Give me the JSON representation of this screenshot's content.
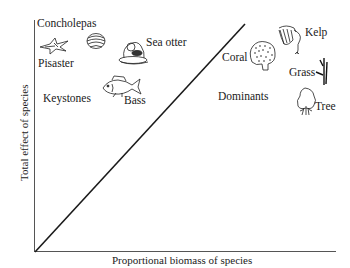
{
  "diagram": {
    "axes": {
      "x_label": "Proportional biomass of species",
      "y_label": "Total effect of species"
    },
    "reference_line": {
      "from": [
        0,
        0
      ],
      "to": [
        0.7,
        1.0
      ],
      "description": "diagonal line from origin"
    },
    "groups": {
      "keystones": {
        "label": "Keystones",
        "region": "above line (upper-left)"
      },
      "dominants": {
        "label": "Dominants",
        "region": "below line (right)"
      }
    },
    "species": [
      {
        "name": "Concholepas",
        "icon": "shell-icon",
        "group": "keystones"
      },
      {
        "name": "Pisaster",
        "icon": "starfish-icon",
        "group": "keystones"
      },
      {
        "name": "Sea otter",
        "icon": "sea-otter-icon",
        "group": "keystones"
      },
      {
        "name": "Bass",
        "icon": "fish-icon",
        "group": "keystones"
      },
      {
        "name": "Coral",
        "icon": "coral-icon",
        "group": "dominants"
      },
      {
        "name": "Kelp",
        "icon": "kelp-icon",
        "group": "dominants"
      },
      {
        "name": "Grass",
        "icon": "grass-icon",
        "group": "dominants"
      },
      {
        "name": "Tree",
        "icon": "tree-icon",
        "group": "dominants"
      }
    ]
  },
  "colors": {
    "line": "#1a1a1a",
    "axis": "#555555",
    "text": "#1a1a1a"
  }
}
